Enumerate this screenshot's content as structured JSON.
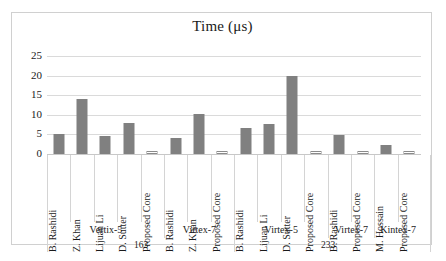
{
  "chart_data": {
    "type": "bar",
    "title": "Time (μs)",
    "xlabel": "",
    "ylabel": "",
    "ylim": [
      0,
      25
    ],
    "yticks": [
      0,
      5,
      10,
      15,
      20,
      25
    ],
    "grid": true,
    "legend": "none",
    "categories": [
      "B. Rashidi",
      "Z. Khan",
      "Lijuan Li",
      "D. Sutter",
      "Proposed Core",
      "B. Rashidi",
      "Z. Khan",
      "Proposed Core",
      "B. Rashidi",
      "Lijuan Li",
      "D. Sutter",
      "Proposed Core",
      "B. Rashidi",
      "Proposed Core",
      "M. Hossain",
      "Proposed Core"
    ],
    "values": [
      5.0,
      14.0,
      4.6,
      8.0,
      0.4,
      4.0,
      10.3,
      0.4,
      6.7,
      7.7,
      19.8,
      0.6,
      4.8,
      0.4,
      2.4,
      0.5
    ],
    "styles": [
      "solid",
      "solid",
      "solid",
      "solid",
      "hollow",
      "solid",
      "solid",
      "hollow",
      "solid",
      "solid",
      "solid",
      "hollow",
      "solid",
      "hollow",
      "solid",
      "hollow"
    ],
    "groups": [
      {
        "label": "Vertix-5",
        "span": 5
      },
      {
        "label": "Virtex-7",
        "span": 3
      },
      {
        "label": "Virtex-5",
        "span": 4
      },
      {
        "label": "Virtex-7",
        "span": 2
      },
      {
        "label": "Kintex-7",
        "span": 2
      }
    ],
    "supergroups": [
      {
        "label": "163",
        "span": 8
      },
      {
        "label": "233",
        "span": 8
      }
    ],
    "colors": {
      "bar_fill": "#808080",
      "bar_outline": "#8a8a8a",
      "grid": "#dadada",
      "text": "#1a1a1a"
    }
  }
}
